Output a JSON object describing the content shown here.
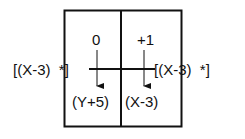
{
  "diagram": {
    "cells": {
      "top_left_value": "0",
      "top_right_value": "+1",
      "bottom_left_expr": "(Y+5)",
      "bottom_right_expr": "(X-3)"
    },
    "left_input": "[(X-3)  *]",
    "right_output": "[(X-3)  *]",
    "colors": {
      "stroke": "#111111",
      "background": "#ffffff"
    }
  }
}
